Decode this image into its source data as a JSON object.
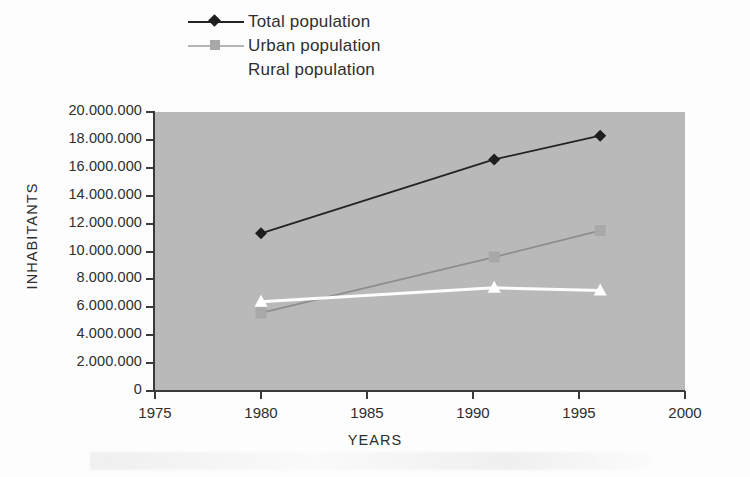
{
  "chart_data": {
    "type": "line",
    "title": "",
    "xlabel": "YEARS",
    "ylabel": "INHABITANTS",
    "xlim": [
      1975,
      2000
    ],
    "ylim": [
      0,
      20000000
    ],
    "xticks": [
      1975,
      1980,
      1985,
      1990,
      1995,
      2000
    ],
    "xtick_labels": [
      "1975",
      "1980",
      "1985",
      "1990",
      "1995",
      "2000"
    ],
    "yticks": [
      0,
      2000000,
      4000000,
      6000000,
      8000000,
      10000000,
      12000000,
      14000000,
      16000000,
      18000000,
      20000000
    ],
    "ytick_labels": [
      "0",
      "2.000.000",
      "4.000.000",
      "6.000.000",
      "8.000.000",
      "10.000.000",
      "12.000.000",
      "14.000.000",
      "16.000.000",
      "18.000.000",
      "20.000.000"
    ],
    "grid": false,
    "legend_position": "top-center",
    "plot_background": "#b9b9b9",
    "x": [
      1980,
      1991,
      1996
    ],
    "series": [
      {
        "name": "Total population",
        "marker": "diamond",
        "color": "#232323",
        "marker_color": "#1e1e1e",
        "values": [
          11300000,
          16600000,
          18300000
        ]
      },
      {
        "name": "Urban population",
        "marker": "square",
        "color": "#8e8e8e",
        "marker_color": "#a8a8a8",
        "values": [
          5600000,
          9600000,
          11500000
        ]
      },
      {
        "name": "Rural population",
        "marker": "triangle",
        "color": "#fdfdfd",
        "marker_color": "#ffffff",
        "values": [
          6400000,
          7400000,
          7200000
        ]
      }
    ]
  },
  "legend": {
    "items": [
      {
        "label": "Total population"
      },
      {
        "label": "Urban population"
      },
      {
        "label": "Rural population"
      }
    ]
  },
  "axes": {
    "y_title": "INHABITANTS",
    "x_title": "YEARS"
  }
}
